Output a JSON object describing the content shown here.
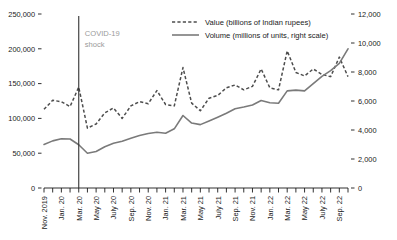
{
  "chart_data": {
    "type": "line",
    "title": "",
    "subtitle": "",
    "xlabel": "",
    "ylabel": "",
    "grid": false,
    "legend_position": "top-center",
    "x": [
      "Nov. 2019",
      "Dec. 19",
      "Jan. 20",
      "Feb. 20",
      "Mar. 20",
      "Apr. 20",
      "May 20",
      "June 20",
      "July 20",
      "Aug. 20",
      "Sep. 20",
      "Oct. 20",
      "Nov. 20",
      "Dec. 20",
      "Jan. 21",
      "Feb. 21",
      "Mar. 21",
      "Apr. 21",
      "May 21",
      "June 21",
      "July 21",
      "Aug. 21",
      "Sep. 21",
      "Oct. 21",
      "Nov. 21",
      "Dec. 21",
      "Jan. 22",
      "Feb. 22",
      "Mar. 22",
      "Apr. 22",
      "May 22",
      "June 22",
      "July 22",
      "Aug. 22",
      "Sep. 22",
      "Oct. 22"
    ],
    "x_tick_labels": [
      "Nov. 2019",
      "Jan. 20",
      "Mar. 20",
      "May 20",
      "July 20",
      "Sep. 20",
      "Nov. 20",
      "Jan. 21",
      "Mar. 21",
      "May 21",
      "July 21",
      "Sep. 21",
      "Nov. 21",
      "Jan. 22",
      "Mar. 22",
      "May 22",
      "July 22",
      "Sep. 22"
    ],
    "x_tick_every": 2,
    "left_axis": {
      "label": "",
      "ticks": [
        0,
        50000,
        100000,
        150000,
        200000,
        250000
      ],
      "tick_labels": [
        "0",
        "50,000",
        "100,000",
        "150,000",
        "200,000",
        "250,000"
      ],
      "ylim": [
        0,
        250000
      ]
    },
    "right_axis": {
      "label": "",
      "ticks": [
        0,
        2000,
        4000,
        6000,
        8000,
        10000,
        12000
      ],
      "tick_labels": [
        "0",
        "2,000",
        "4,000",
        "6,000",
        "8,000",
        "10,000",
        "12,000"
      ],
      "ylim": [
        0,
        12000
      ]
    },
    "series": [
      {
        "name": "Value (billions of Indian rupees)",
        "axis": "left",
        "style": "dashed",
        "color": "#4d4d4d",
        "values": [
          113000,
          126000,
          124000,
          117000,
          145000,
          86000,
          92000,
          108000,
          115000,
          100000,
          118000,
          124000,
          121000,
          140000,
          120000,
          118000,
          173000,
          122000,
          111000,
          129000,
          133000,
          144000,
          148000,
          141000,
          146000,
          171000,
          144000,
          141000,
          197000,
          166000,
          161000,
          171000,
          163000,
          160000,
          188000,
          160000
        ]
      },
      {
        "name": "Volume (millions of units, right scale)",
        "axis": "right",
        "style": "solid",
        "color": "#7a7a7a",
        "values": [
          3000,
          3250,
          3400,
          3380,
          2980,
          2400,
          2520,
          2850,
          3080,
          3230,
          3430,
          3620,
          3760,
          3850,
          3780,
          4080,
          5000,
          4480,
          4370,
          4620,
          4880,
          5150,
          5460,
          5580,
          5720,
          6030,
          5880,
          5840,
          6700,
          6750,
          6700,
          7200,
          7700,
          8100,
          8600,
          9600
        ]
      }
    ],
    "annotations": [
      {
        "name": "covid-19-shock",
        "text_line1": "COVID-19",
        "text_line2": "shock",
        "x": "Mar. 20",
        "type": "vline",
        "color": "#9a9a9a"
      }
    ]
  }
}
